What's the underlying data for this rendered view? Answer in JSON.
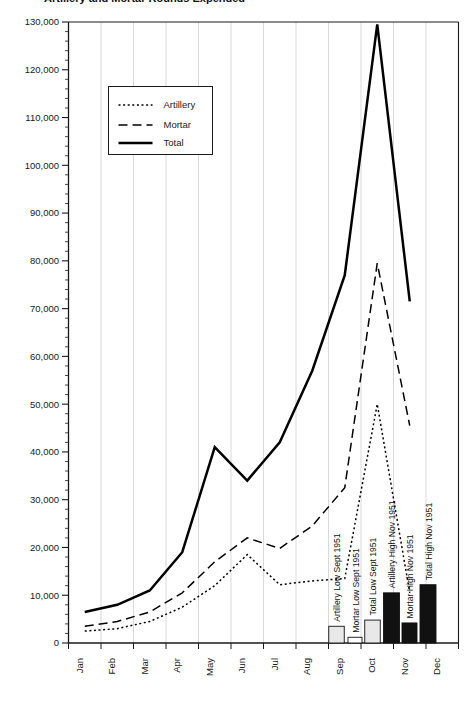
{
  "chart_data": {
    "type": "line",
    "title": "Artillery and Mortar Rounds Expended",
    "xlabel": "",
    "ylabel": "",
    "categories": [
      "Jan",
      "Feb",
      "Mar",
      "Apr",
      "May",
      "Jun",
      "Jul",
      "Aug",
      "Sep",
      "Oct",
      "Nov",
      "Dec"
    ],
    "ylim": [
      0,
      130000
    ],
    "ytick_step": 10000,
    "yticks": [
      0,
      10000,
      20000,
      30000,
      40000,
      50000,
      60000,
      70000,
      80000,
      90000,
      100000,
      110000,
      120000,
      130000
    ],
    "ytick_labels": [
      "0",
      "10,000",
      "20,000",
      "30,000",
      "40,000",
      "50,000",
      "60,000",
      "70,000",
      "80,000",
      "90,000",
      "100,000",
      "110,000",
      "120,000",
      "130,000"
    ],
    "minor_ticks": true,
    "grid": "vertical",
    "legend_position": "upper-left-inset",
    "series": [
      {
        "name": "Artillery",
        "style": "dotted",
        "values": [
          2500,
          3000,
          4500,
          7500,
          12000,
          18500,
          12200,
          13000,
          13500,
          50000,
          10500,
          null
        ]
      },
      {
        "name": "Mortar",
        "style": "dashed",
        "values": [
          3500,
          4500,
          6500,
          10500,
          17000,
          22000,
          19800,
          24500,
          32500,
          79500,
          45500,
          null
        ]
      },
      {
        "name": "Total",
        "style": "solid",
        "values": [
          6500,
          8000,
          11000,
          19000,
          41000,
          34000,
          42000,
          57000,
          77000,
          129500,
          71500,
          null
        ]
      }
    ],
    "annotation_bars": [
      {
        "label": "Artillery Low Sept 1951",
        "value": 3500,
        "fill": "light",
        "month": "Sep"
      },
      {
        "label": "Mortar Low Sept 1951",
        "value": 1200,
        "fill": "white",
        "month": "Sep"
      },
      {
        "label": "Total Low Sept 1951",
        "value": 4800,
        "fill": "light",
        "month": "Sep"
      },
      {
        "label": "Artillery High Nov 1951",
        "value": 10500,
        "fill": "black",
        "month": "Oct"
      },
      {
        "label": "Mortar High Nov 1951",
        "value": 4200,
        "fill": "black",
        "month": "Oct"
      },
      {
        "label": "Total High Nov 1951",
        "value": 12200,
        "fill": "black",
        "month": "Nov"
      }
    ]
  },
  "legend": {
    "items": [
      {
        "label": "Artillery"
      },
      {
        "label": "Mortar"
      },
      {
        "label": "Total"
      }
    ]
  },
  "axis": {
    "y_labels": [
      "130,000",
      "120,000",
      "110,000",
      "100,000",
      "90,000",
      "80,000",
      "70,000",
      "60,000",
      "50,000",
      "40,000",
      "30,000",
      "20,000",
      "10,000",
      "0"
    ],
    "x_labels": [
      "Jan",
      "Feb",
      "Mar",
      "Apr",
      "May",
      "Jun",
      "Jul",
      "Aug",
      "Sep",
      "Oct",
      "Nov",
      "Dec"
    ]
  },
  "colors": {
    "axis": "#1a1a1a",
    "grid": "#c8c8c8",
    "series": "#000000",
    "bar_light": "#e8e8e8",
    "bar_white": "#ffffff",
    "bar_black": "#111111"
  }
}
